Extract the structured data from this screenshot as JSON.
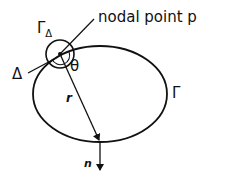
{
  "diagram": {
    "labels": {
      "nodal_point": "nodal point p",
      "gamma_delta_main": "Γ",
      "gamma_delta_sub": "Δ",
      "delta": "Δ",
      "theta": "θ",
      "gamma": "Γ",
      "r": "r",
      "n": "n"
    },
    "colors": {
      "stroke": "#111111",
      "background": "#ffffff"
    }
  }
}
